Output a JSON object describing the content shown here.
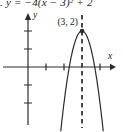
{
  "figure": {
    "equation": ". y = −4(x − 3)² + 2",
    "vertex_label": "(3, 2)",
    "x_axis_label": "x",
    "y_axis_label": "y"
  },
  "colors": {
    "background": "#ffffff",
    "stroke": "#2b2b2b",
    "text": "#1a1a1a"
  },
  "chart_data": {
    "type": "line",
    "function": {
      "form": "y = a(x − h)² + k",
      "a": -4,
      "h": 3,
      "k": 2
    },
    "vertex": [
      3,
      2
    ],
    "axis_of_symmetry": 3,
    "x_intercepts": [
      2.29,
      3.71
    ],
    "opens": "down",
    "x_ticks": [
      1,
      2,
      4
    ],
    "y_ticks": [
      -2,
      -1,
      1,
      2
    ],
    "xlim": [
      -1.4,
      4.8
    ],
    "ylim": [
      -3.4,
      2.9
    ],
    "grid": false,
    "annotations": [
      "(3, 2)"
    ],
    "xlabel": "x",
    "ylabel": "y"
  }
}
